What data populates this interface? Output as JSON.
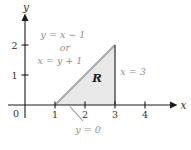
{
  "figure_type": "shaded-region-plot",
  "background": "#ffffff",
  "axes": {
    "x_label": "x",
    "y_label": "y",
    "origin_label": "0",
    "x_ticks": [
      "1",
      "2",
      "3",
      "4"
    ],
    "y_ticks": [
      "1",
      "2"
    ],
    "color": "#1b1b1b",
    "tick_label_color": "#2e2e2e"
  },
  "region": {
    "label": "R",
    "label_color": "#1f1f1f",
    "fill_color": "#e9e9e9",
    "hypotenuse_color": "#a9a9a9",
    "right_edge_color": "#3d3d3d",
    "vertices": [
      [
        1,
        0
      ],
      [
        3,
        0
      ],
      [
        3,
        2
      ]
    ]
  },
  "annotations": {
    "color": "#8f8f8f",
    "hypotenuse_eq_line1": "y = x − 1",
    "hypotenuse_eq_line2": "or",
    "hypotenuse_eq_line3": "x = y + 1",
    "right_edge_eq": "x = 3",
    "bottom_edge_eq": "y = 0"
  }
}
